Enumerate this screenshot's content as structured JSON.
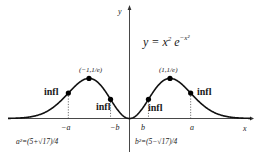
{
  "diagram": {
    "title_equation": {
      "lhs": "y = x",
      "exp1": "2",
      "mid": " e",
      "exp2": "−x²"
    },
    "axes": {
      "x_label": "x",
      "y_label": "y"
    },
    "maxima": [
      {
        "label": "(−1,1/e)",
        "x": -1,
        "y": 0.3679
      },
      {
        "label": "(1,1/e)",
        "x": 1,
        "y": 0.3679
      }
    ],
    "inflection_points": [
      {
        "label": "infl",
        "position": "-a"
      },
      {
        "label": "infl",
        "position": "-b"
      },
      {
        "label": "infl",
        "position": "b"
      },
      {
        "label": "infl",
        "position": "a"
      }
    ],
    "ticks": [
      {
        "label": "−a"
      },
      {
        "label": "−b"
      },
      {
        "label": "b"
      },
      {
        "label": "a"
      }
    ],
    "notes": {
      "a_squared": "a²=(5+√17)/4",
      "b_squared": "b²=(5−√17)/4"
    },
    "colors": {
      "curve": "#111111",
      "axis": "#333333",
      "dots": "#000000",
      "background": "#ffffff"
    }
  }
}
